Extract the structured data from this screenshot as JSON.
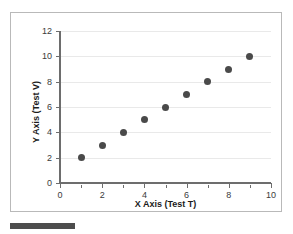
{
  "chart_data": {
    "type": "scatter",
    "title": "",
    "xlabel": "X Axis (Test T)",
    "ylabel": "Y Axis (Test V)",
    "xlim": [
      0,
      10
    ],
    "ylim": [
      0,
      12
    ],
    "x": [
      1,
      2,
      3,
      4,
      5,
      6,
      7,
      8,
      9
    ],
    "values": [
      2,
      3,
      4,
      5,
      6,
      7,
      8,
      9,
      10
    ],
    "points": [
      {
        "x": 1,
        "y": 2
      },
      {
        "x": 2,
        "y": 3
      },
      {
        "x": 3,
        "y": 4
      },
      {
        "x": 4,
        "y": 5
      },
      {
        "x": 5,
        "y": 6
      },
      {
        "x": 6,
        "y": 7
      },
      {
        "x": 7,
        "y": 8
      },
      {
        "x": 8,
        "y": 9
      },
      {
        "x": 9,
        "y": 10
      }
    ],
    "xticks": [
      0,
      2,
      4,
      6,
      8,
      10
    ],
    "xticklabels": [
      "0",
      "2",
      "4",
      "6",
      "8",
      "10"
    ],
    "xminorticks": [
      1,
      3,
      5,
      7,
      9
    ],
    "yticks": [
      0,
      2,
      4,
      6,
      8,
      10,
      12
    ],
    "yticklabels": [
      "0",
      "2",
      "4",
      "6",
      "8",
      "10",
      "12"
    ],
    "gridlines": [
      2,
      4,
      6,
      8,
      10,
      12
    ],
    "grid": true,
    "legend": null,
    "legend_position": "none",
    "marker_color": "#4a4a4a",
    "grid_color": "#e9e9e9",
    "axis_color": "#6d6d6d",
    "border_color": "#b9b9b9",
    "bar_color": "#4d4d4d"
  }
}
